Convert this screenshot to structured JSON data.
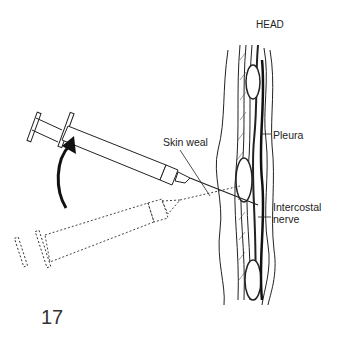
{
  "figure": {
    "number": "17",
    "labels": {
      "head": "HEAD",
      "skin_weal": "Skin weal",
      "pleura": "Pleura",
      "intercostal_nerve_line1": "Intercostal",
      "intercostal_nerve_line2": "nerve"
    },
    "colors": {
      "line": "#222222",
      "background": "#ffffff"
    }
  }
}
